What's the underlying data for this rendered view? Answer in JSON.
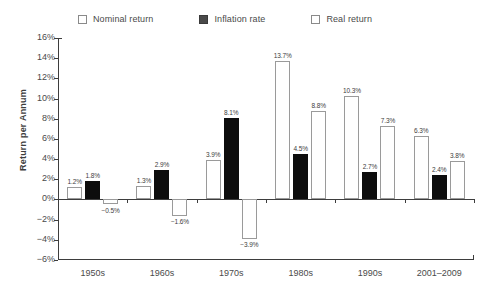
{
  "chart_data": {
    "type": "bar",
    "title": "",
    "xlabel": "",
    "ylabel": "Return per Annum",
    "ylim": [
      -6,
      16
    ],
    "ytick_step": 2,
    "grid": false,
    "legend_position": "top",
    "categories": [
      "1950s",
      "1960s",
      "1970s",
      "1980s",
      "1990s",
      "2001–2009"
    ],
    "series": [
      {
        "name": "Nominal return",
        "style": "open",
        "values": [
          1.2,
          1.3,
          3.9,
          13.7,
          10.3,
          6.3
        ],
        "labels": [
          "1.2%",
          "1.3%",
          "3.9%",
          "13.7%",
          "10.3%",
          "6.3%"
        ]
      },
      {
        "name": "Inflation rate",
        "style": "filled",
        "values": [
          1.8,
          2.9,
          8.1,
          4.5,
          2.7,
          2.4
        ],
        "labels": [
          "1.8%",
          "2.9%",
          "8.1%",
          "4.5%",
          "2.7%",
          "2.4%"
        ]
      },
      {
        "name": "Real return",
        "style": "open",
        "values": [
          -0.5,
          -1.6,
          -3.9,
          8.8,
          7.3,
          3.8
        ],
        "labels": [
          "−0.5%",
          "−1.6%",
          "−3.9%",
          "8.8%",
          "7.3%",
          "3.8%"
        ]
      }
    ],
    "ytick_labels": [
      "16%",
      "14%",
      "12%",
      "10%",
      "8%",
      "6%",
      "4%",
      "2%",
      "0%",
      "−2%",
      "−4%",
      "−6%"
    ],
    "ytick_values": [
      16,
      14,
      12,
      10,
      8,
      6,
      4,
      2,
      0,
      -2,
      -4,
      -6
    ]
  },
  "legend": {
    "items": [
      {
        "label": "Nominal return",
        "swatch": "open-square-icon"
      },
      {
        "label": "Inflation rate",
        "swatch": "filled-square-icon"
      },
      {
        "label": "Real return",
        "swatch": "open-square-icon"
      }
    ]
  },
  "colors": {
    "open_bar_fill": "#ffffff",
    "open_bar_stroke": "#9a9a9a",
    "filled_bar": "#0d0d0d",
    "axis": "#3d3d3d",
    "text": "#4a4a4a",
    "background": "#ffffff"
  }
}
